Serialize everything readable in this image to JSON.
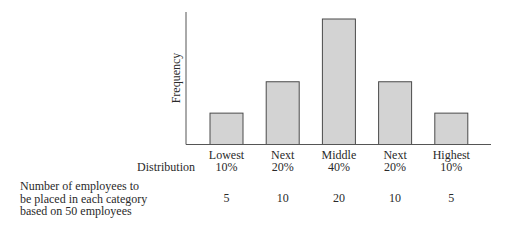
{
  "chart_data": {
    "type": "bar",
    "title": "",
    "xlabel": "Distribution",
    "ylabel": "Frequency",
    "categories": [
      {
        "line1": "Lowest",
        "line2": "10%"
      },
      {
        "line1": "Next",
        "line2": "20%"
      },
      {
        "line1": "Middle",
        "line2": "40%"
      },
      {
        "line1": "Next",
        "line2": "20%"
      },
      {
        "line1": "Highest",
        "line2": "10%"
      }
    ],
    "category_labels": [
      "Lowest 10%",
      "Next 20%",
      "Middle 40%",
      "Next 20%",
      "Highest 10%"
    ],
    "percentages": [
      10,
      20,
      40,
      20,
      10
    ],
    "values": [
      5,
      10,
      20,
      10,
      5
    ],
    "ylim": [
      0,
      21
    ],
    "grid": false,
    "legend": null,
    "y_ticks": false
  },
  "row_label": {
    "lines": [
      "Number of employees to",
      "be placed in each category",
      "based on 50 employees"
    ]
  },
  "colors": {
    "bar_fill": "#d3d3d3",
    "bar_stroke": "#4a4a4a",
    "axis": "#555555",
    "text": "#2a2a2a"
  }
}
